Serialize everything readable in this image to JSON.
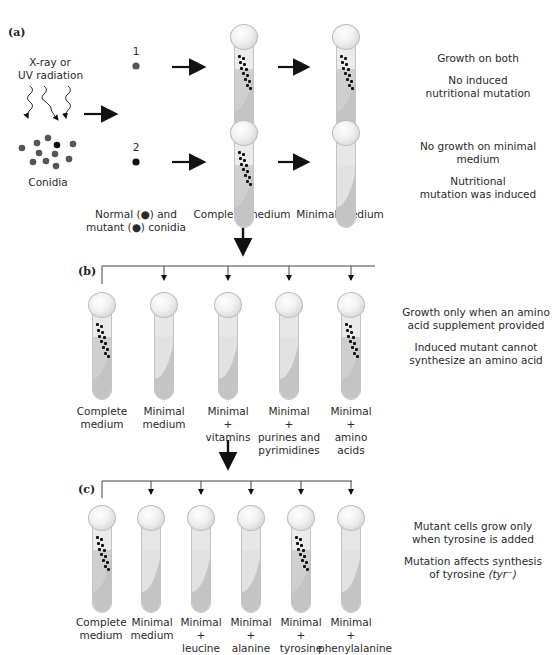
{
  "panels": {
    "a": {
      "label": "(a)",
      "radiation_label_line1": "X-ray or",
      "radiation_label_line2": "UV radiation",
      "conidia_label": "Conidia",
      "row1_number": "1",
      "row2_number": "2",
      "legend_line1": "Normal (●) and",
      "legend_line2": "mutant (●) conidia",
      "col_complete": "Complete medium",
      "col_minimal": "Minimal medium",
      "row1_desc_1": "Growth on both",
      "row1_desc_2a": "No induced",
      "row1_desc_2b": "nutritional mutation",
      "row2_desc_1a": "No growth on minimal",
      "row2_desc_1b": "medium",
      "row2_desc_2a": "Nutritional",
      "row2_desc_2b": "mutation was induced",
      "tubes": [
        {
          "medium": "Complete medium",
          "row": 1,
          "growth": true
        },
        {
          "medium": "Minimal medium",
          "row": 1,
          "growth": true
        },
        {
          "medium": "Complete medium",
          "row": 2,
          "growth": true
        },
        {
          "medium": "Minimal medium",
          "row": 2,
          "growth": false
        }
      ]
    },
    "b": {
      "label": "(b)",
      "tubes": [
        {
          "line1": "Complete",
          "line2": "medium",
          "line3": "",
          "line4": "",
          "growth": true
        },
        {
          "line1": "Minimal",
          "line2": "medium",
          "line3": "",
          "line4": "",
          "growth": false
        },
        {
          "line1": "Minimal",
          "line2": "+",
          "line3": "vitamins",
          "line4": "",
          "growth": false
        },
        {
          "line1": "Minimal",
          "line2": "+",
          "line3": "purines and",
          "line4": "pyrimidines",
          "growth": false
        },
        {
          "line1": "Minimal",
          "line2": "+",
          "line3": "amino",
          "line4": "acids",
          "growth": true
        }
      ],
      "desc_1a": "Growth only when an amino",
      "desc_1b": "acid supplement provided",
      "desc_2a": "Induced mutant cannot",
      "desc_2b": "synthesize an amino acid"
    },
    "c": {
      "label": "(c)",
      "tubes": [
        {
          "line1": "Complete",
          "line2": "medium",
          "line3": "",
          "growth": true
        },
        {
          "line1": "Minimal",
          "line2": "medium",
          "line3": "",
          "growth": false
        },
        {
          "line1": "Minimal",
          "line2": "+",
          "line3": "leucine",
          "growth": false
        },
        {
          "line1": "Minimal",
          "line2": "+",
          "line3": "alanine",
          "growth": false
        },
        {
          "line1": "Minimal",
          "line2": "+",
          "line3": "tyrosine",
          "growth": true
        },
        {
          "line1": "Minimal",
          "line2": "+",
          "line3": "phenylalanine",
          "growth": false
        }
      ],
      "desc_1a": "Mutant cells grow only",
      "desc_1b": "when tyrosine is added",
      "desc_2a": "Mutation affects synthesis",
      "desc_2b": "of tyrosine ",
      "desc_2c": "(tyr⁻)"
    }
  },
  "colors": {
    "normal_conidium": "#555555",
    "mutant_conidium": "#111111",
    "agar": "#c4c4c4",
    "arrow": "#111111"
  }
}
